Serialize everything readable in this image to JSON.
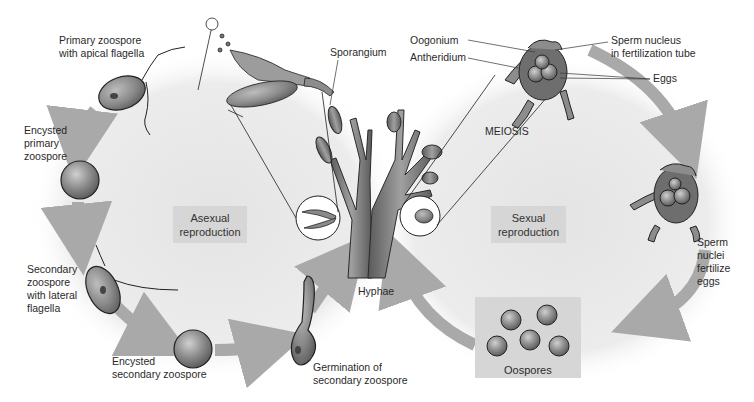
{
  "figure": {
    "regions": {
      "asexual": "Asexual\nreproduction",
      "sexual": "Sexual\nreproduction"
    },
    "labels": {
      "primary_zoospore": "Primary zoospore\nwith apical flagella",
      "encysted_primary": "Encysted\nprimary\nzoospore",
      "secondary_zoospore": "Secondary\nzoospore\nwith lateral\nflagella",
      "encysted_secondary": "Encysted\nsecondary zoospore",
      "germination": "Germination of\nsecondary zoospore",
      "hyphae": "Hyphae",
      "sporangium": "Sporangium",
      "oogonium": "Oogonium",
      "antheridium": "Antheridium",
      "sperm_nucleus": "Sperm nucleus\nin fertilization tube",
      "eggs": "Eggs",
      "meiosis": "MEIOSIS",
      "sperm_fertilize": "Sperm\nnuclei\nfertilize\neggs",
      "oospores": "Oospores"
    },
    "colors": {
      "arrow": "#a9a9a9",
      "cell_fill": "#8c8c8c",
      "outline": "#1a1a1a",
      "region_bg": "#e9e9e9",
      "label_box": "#d6d6d6"
    }
  }
}
